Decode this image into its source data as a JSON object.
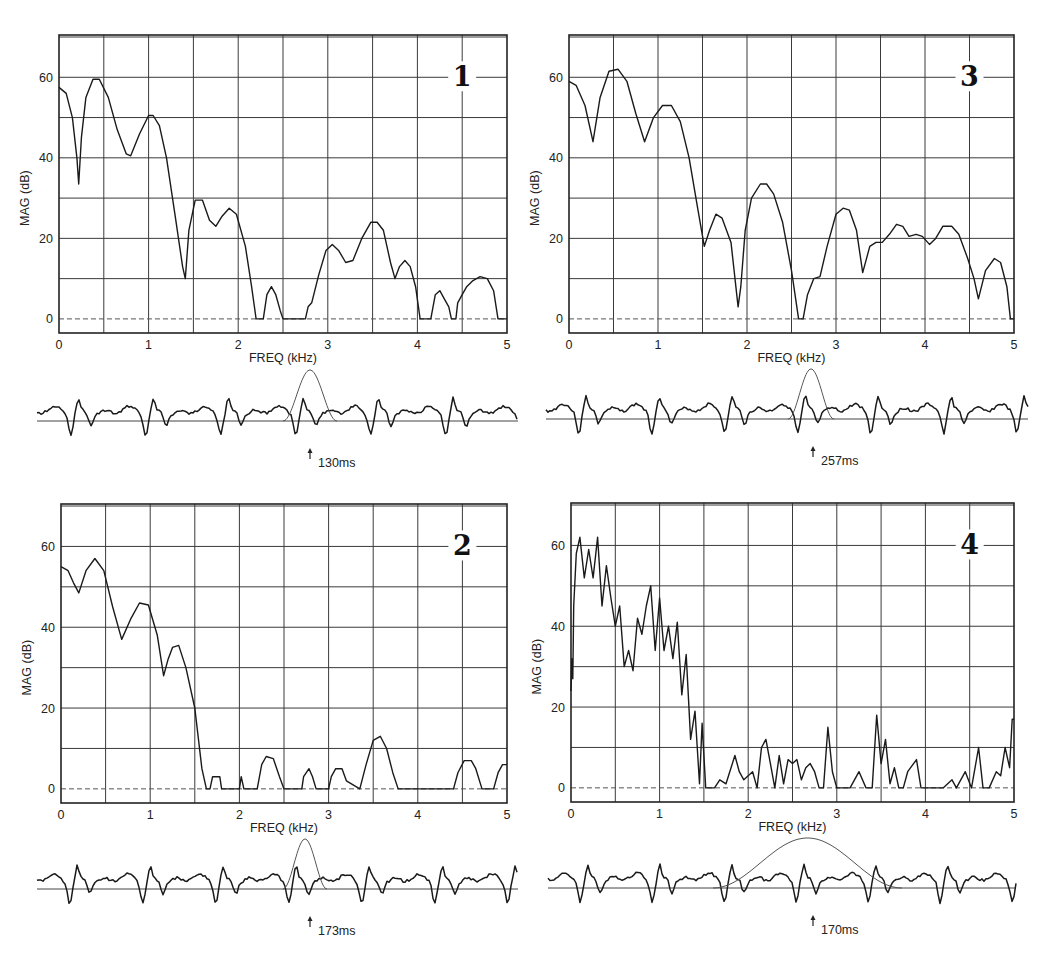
{
  "chart_data": [
    {
      "type": "line",
      "panel": "1",
      "xlabel": "FREQ (kHz)",
      "ylabel": "MAG (dB)",
      "xlim": [
        0,
        5
      ],
      "ylim": [
        -3.5,
        70.5
      ],
      "xticks": [
        "0",
        "1",
        "2",
        "3",
        "4",
        "5"
      ],
      "yticks": [
        "0",
        "20",
        "40",
        "60"
      ],
      "grid": true,
      "marker_time": "130ms",
      "window_width": "narrow",
      "series": [
        {
          "name": "spectrum",
          "x": [
            0,
            0.08,
            0.15,
            0.2,
            0.22,
            0.25,
            0.3,
            0.38,
            0.45,
            0.55,
            0.65,
            0.75,
            0.8,
            0.9,
            1.0,
            1.05,
            1.12,
            1.2,
            1.3,
            1.38,
            1.41,
            1.45,
            1.52,
            1.6,
            1.68,
            1.75,
            1.82,
            1.9,
            1.98,
            2.08,
            2.15,
            2.2,
            2.25,
            2.28,
            2.32,
            2.37,
            2.42,
            2.47,
            2.5,
            2.6,
            2.75,
            2.78,
            2.82,
            2.9,
            2.98,
            3.05,
            3.12,
            3.2,
            3.28,
            3.38,
            3.48,
            3.55,
            3.62,
            3.7,
            3.75,
            3.8,
            3.86,
            3.92,
            3.98,
            4.03,
            4.12,
            4.15,
            4.2,
            4.25,
            4.3,
            4.35,
            4.38,
            4.43,
            4.45,
            4.5,
            4.55,
            4.62,
            4.7,
            4.78,
            4.85,
            4.9,
            5.0
          ],
          "y": [
            57.5,
            56,
            50,
            40,
            33.5,
            45,
            55,
            59.5,
            59.5,
            55,
            47,
            41,
            40.5,
            46,
            50.5,
            50.5,
            48,
            40,
            25,
            13,
            10,
            22,
            29.5,
            29.5,
            24.5,
            23,
            25.5,
            27.5,
            26,
            18,
            8,
            0,
            0,
            0,
            6,
            8,
            6,
            2,
            0,
            0,
            0,
            3,
            4,
            11,
            17,
            18.5,
            17,
            14,
            14.5,
            20,
            24,
            24,
            22,
            14,
            10,
            13,
            14.5,
            13,
            8,
            0,
            0,
            0,
            6,
            7,
            5,
            3,
            0,
            0,
            4,
            6,
            8,
            9.5,
            10.5,
            10,
            7,
            0,
            0
          ]
        }
      ]
    },
    {
      "type": "line",
      "panel": "3",
      "xlabel": "FREQ (kHz)",
      "ylabel": "MAG (dB)",
      "xlim": [
        0,
        5
      ],
      "ylim": [
        -3.5,
        70.5
      ],
      "xticks": [
        "0",
        "1",
        "2",
        "3",
        "4",
        "5"
      ],
      "yticks": [
        "0",
        "20",
        "40",
        "60"
      ],
      "grid": true,
      "marker_time": "257ms",
      "window_width": "narrow",
      "series": [
        {
          "name": "spectrum",
          "x": [
            0,
            0.08,
            0.18,
            0.27,
            0.35,
            0.45,
            0.55,
            0.65,
            0.75,
            0.85,
            0.95,
            1.05,
            1.15,
            1.25,
            1.35,
            1.45,
            1.52,
            1.58,
            1.65,
            1.72,
            1.82,
            1.9,
            1.93,
            1.98,
            2.05,
            2.15,
            2.22,
            2.3,
            2.4,
            2.5,
            2.58,
            2.63,
            2.68,
            2.75,
            2.82,
            2.9,
            3.0,
            3.08,
            3.15,
            3.23,
            3.3,
            3.38,
            3.45,
            3.52,
            3.6,
            3.68,
            3.75,
            3.82,
            3.9,
            3.97,
            4.05,
            4.12,
            4.2,
            4.3,
            4.38,
            4.48,
            4.55,
            4.6,
            4.68,
            4.78,
            4.85,
            4.92,
            4.96,
            5.0
          ],
          "y": [
            59,
            58,
            53,
            44,
            55,
            61.5,
            62,
            59,
            51,
            44,
            50,
            53,
            53,
            49,
            40,
            27,
            18,
            22,
            26,
            25,
            19,
            3,
            8,
            22,
            30,
            33.5,
            33.5,
            31,
            24,
            12,
            0,
            0,
            6,
            10,
            10.5,
            18,
            26,
            27.5,
            27,
            22,
            11.5,
            18,
            19,
            19,
            21,
            23.5,
            23,
            20.5,
            21,
            20.5,
            18.5,
            20,
            23,
            23,
            21,
            15,
            10,
            5,
            12,
            15,
            14,
            8,
            0,
            0
          ]
        }
      ]
    },
    {
      "type": "line",
      "panel": "2",
      "xlabel": "FREQ (kHz)",
      "ylabel": "MAG (dB)",
      "xlim": [
        0,
        5
      ],
      "ylim": [
        -3.5,
        70.5
      ],
      "xticks": [
        "0",
        "1",
        "2",
        "3",
        "4",
        "5"
      ],
      "yticks": [
        "0",
        "20",
        "40",
        "60"
      ],
      "grid": true,
      "marker_time": "173ms",
      "window_width": "narrow",
      "series": [
        {
          "name": "spectrum",
          "x": [
            0,
            0.08,
            0.14,
            0.2,
            0.28,
            0.38,
            0.48,
            0.58,
            0.68,
            0.78,
            0.88,
            0.98,
            1.08,
            1.15,
            1.2,
            1.25,
            1.32,
            1.4,
            1.5,
            1.58,
            1.63,
            1.67,
            1.7,
            1.73,
            1.78,
            1.8,
            2.0,
            2.02,
            2.05,
            2.2,
            2.25,
            2.3,
            2.38,
            2.45,
            2.5,
            2.7,
            2.72,
            2.78,
            2.82,
            2.86,
            3.0,
            3.03,
            3.08,
            3.15,
            3.2,
            3.35,
            3.42,
            3.5,
            3.58,
            3.65,
            3.72,
            3.78,
            4.4,
            4.45,
            4.52,
            4.6,
            4.65,
            4.72,
            4.85,
            4.9,
            4.95,
            5.0
          ],
          "y": [
            55,
            54,
            51,
            48.5,
            54,
            57,
            54,
            45,
            37,
            42,
            46,
            45.5,
            38,
            28,
            32,
            35,
            35.5,
            30,
            20,
            5,
            0,
            0,
            3,
            3,
            3,
            0,
            0,
            3,
            0,
            0,
            6,
            8,
            7.5,
            3,
            0,
            0,
            3,
            5,
            3,
            0,
            0,
            3,
            5,
            5,
            2,
            0,
            6,
            12,
            13,
            10,
            4,
            0,
            0,
            4,
            7,
            7,
            5,
            0,
            0,
            4,
            6,
            6
          ]
        }
      ]
    },
    {
      "type": "line",
      "panel": "4",
      "xlabel": "FREQ (kHz)",
      "ylabel": "MAG (dB)",
      "xlim": [
        0,
        5
      ],
      "ylim": [
        -3.5,
        70.5
      ],
      "xticks": [
        "0",
        "1",
        "2",
        "3",
        "4",
        "5"
      ],
      "yticks": [
        "0",
        "20",
        "40",
        "60"
      ],
      "grid": true,
      "marker_time": "170ms",
      "window_width": "wide",
      "series": [
        {
          "name": "spectrum",
          "x": [
            0,
            0.01,
            0.02,
            0.03,
            0.06,
            0.1,
            0.15,
            0.2,
            0.25,
            0.3,
            0.35,
            0.4,
            0.45,
            0.5,
            0.55,
            0.6,
            0.65,
            0.7,
            0.75,
            0.8,
            0.85,
            0.9,
            0.95,
            1.0,
            1.05,
            1.1,
            1.15,
            1.2,
            1.25,
            1.3,
            1.35,
            1.4,
            1.45,
            1.48,
            1.52,
            1.57,
            1.62,
            1.68,
            1.75,
            1.85,
            1.9,
            1.95,
            2.0,
            2.05,
            2.1,
            2.15,
            2.2,
            2.25,
            2.3,
            2.35,
            2.4,
            2.45,
            2.5,
            2.55,
            2.6,
            2.65,
            2.7,
            2.75,
            2.8,
            2.85,
            2.9,
            2.95,
            3.0,
            3.05,
            3.1,
            3.15,
            3.25,
            3.33,
            3.4,
            3.45,
            3.5,
            3.55,
            3.6,
            3.65,
            3.7,
            3.75,
            3.8,
            3.9,
            3.95,
            4.03,
            4.08,
            4.2,
            4.3,
            4.35,
            4.45,
            4.52,
            4.6,
            4.65,
            4.72,
            4.8,
            4.85,
            4.9,
            4.95,
            4.98,
            5.0
          ],
          "y": [
            24,
            32,
            27,
            45,
            58,
            62,
            52,
            59,
            52,
            62,
            45,
            55,
            47,
            40,
            45,
            30,
            34,
            29,
            42,
            38,
            45,
            50,
            34,
            47,
            34,
            40,
            32,
            41,
            23,
            33,
            12,
            19,
            1,
            16,
            0,
            0,
            0,
            2,
            1,
            8,
            4,
            2,
            3,
            4,
            0,
            10,
            12,
            6,
            0,
            8,
            1,
            7,
            6,
            7,
            2,
            5,
            6,
            4,
            0,
            0,
            15,
            4,
            0,
            0,
            0,
            0,
            4,
            0,
            0,
            18,
            6,
            12,
            1,
            5,
            0,
            0,
            4,
            7,
            0,
            0,
            0,
            0,
            2,
            0,
            4,
            0,
            10,
            0,
            0,
            4,
            3,
            10,
            5,
            17,
            17
          ]
        }
      ]
    }
  ],
  "panels": [
    {
      "id": "1",
      "number": "1",
      "xlabel": "FREQ (kHz)",
      "ylabel": "MAG (dB)",
      "time": "130ms"
    },
    {
      "id": "3",
      "number": "3",
      "xlabel": "FREQ (kHz)",
      "ylabel": "MAG (dB)",
      "time": "257ms"
    },
    {
      "id": "2",
      "number": "2",
      "xlabel": "FREQ (kHz)",
      "ylabel": "MAG (dB)",
      "time": "173ms"
    },
    {
      "id": "4",
      "number": "4",
      "xlabel": "FREQ (kHz)",
      "ylabel": "MAG (dB)",
      "time": "170ms"
    }
  ]
}
